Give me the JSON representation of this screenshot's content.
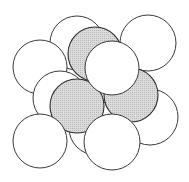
{
  "diagram": {
    "colors": {
      "white_fill": "#ffffff",
      "gray_fill": "#d4d4d4",
      "stroke": "#333333"
    },
    "spheres": [
      {
        "id": "back-top-middle",
        "cx": 77,
        "cy": 43,
        "r": 27,
        "shade": "white"
      },
      {
        "id": "back-top-right",
        "cx": 148,
        "cy": 43,
        "r": 28,
        "shade": "white"
      },
      {
        "id": "back-left",
        "cx": 40,
        "cy": 67,
        "r": 27,
        "shade": "white"
      },
      {
        "id": "hidden-left-middle",
        "cx": 60,
        "cy": 98,
        "r": 27,
        "shade": "white"
      },
      {
        "id": "back-right-lower",
        "cx": 150,
        "cy": 117,
        "r": 28,
        "shade": "white"
      },
      {
        "id": "hidden-bottom-middle",
        "cx": 96,
        "cy": 128,
        "r": 27,
        "shade": "white"
      },
      {
        "id": "gray-top",
        "cx": 95,
        "cy": 54,
        "r": 27,
        "shade": "gray"
      },
      {
        "id": "gray-right",
        "cx": 131,
        "cy": 95,
        "r": 27,
        "shade": "gray"
      },
      {
        "id": "gray-left",
        "cx": 77,
        "cy": 106,
        "r": 27,
        "shade": "gray"
      },
      {
        "id": "front-center",
        "cx": 112,
        "cy": 68,
        "r": 27,
        "shade": "white"
      },
      {
        "id": "front-bottom-left",
        "cx": 40,
        "cy": 141,
        "r": 27,
        "shade": "white"
      },
      {
        "id": "front-bottom-center",
        "cx": 112,
        "cy": 142,
        "r": 28,
        "shade": "white"
      }
    ]
  }
}
